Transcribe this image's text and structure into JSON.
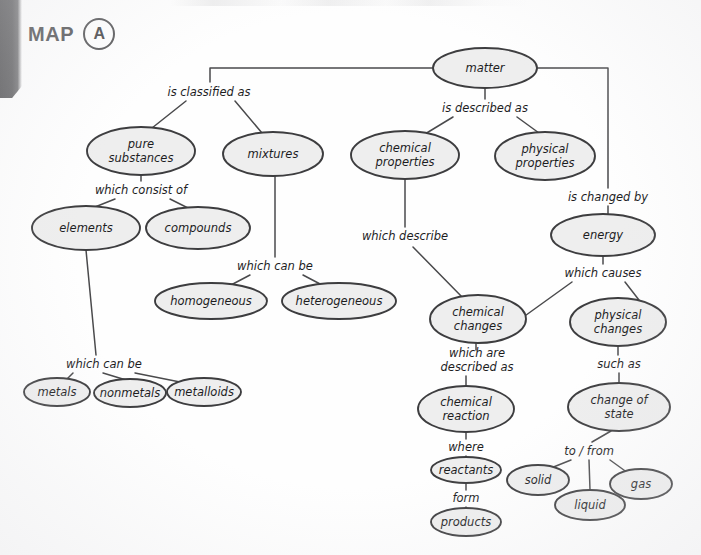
{
  "header": {
    "map_word": "MAP",
    "map_letter": "A"
  },
  "chart_data": {
    "type": "diagram",
    "diagram_kind": "concept-map",
    "title": "MAP A",
    "root": "matter",
    "node_fill_color": "#eeeeee",
    "node_stroke_color": "#3d3d3f",
    "nodes": [
      {
        "id": "matter",
        "label": "matter",
        "cx": 485,
        "cy": 68,
        "rx": 52,
        "ry": 20,
        "lines": [
          "matter"
        ]
      },
      {
        "id": "pure_substances",
        "label": "pure substances",
        "cx": 141,
        "cy": 151,
        "rx": 54,
        "ry": 24,
        "lines": [
          "pure",
          "substances"
        ]
      },
      {
        "id": "mixtures",
        "label": "mixtures",
        "cx": 273,
        "cy": 154,
        "rx": 50,
        "ry": 22,
        "lines": [
          "mixtures"
        ]
      },
      {
        "id": "chemical_properties",
        "label": "chemical properties",
        "cx": 405,
        "cy": 155,
        "rx": 54,
        "ry": 24,
        "lines": [
          "chemical",
          "properties"
        ]
      },
      {
        "id": "physical_properties",
        "label": "physical properties",
        "cx": 545,
        "cy": 156,
        "rx": 50,
        "ry": 24,
        "lines": [
          "physical",
          "properties"
        ]
      },
      {
        "id": "elements",
        "label": "elements",
        "cx": 86,
        "cy": 228,
        "rx": 54,
        "ry": 22,
        "lines": [
          "elements"
        ]
      },
      {
        "id": "compounds",
        "label": "compounds",
        "cx": 198,
        "cy": 228,
        "rx": 52,
        "ry": 21,
        "lines": [
          "compounds"
        ]
      },
      {
        "id": "energy",
        "label": "energy",
        "cx": 603,
        "cy": 235,
        "rx": 52,
        "ry": 21,
        "lines": [
          "energy"
        ]
      },
      {
        "id": "homogeneous",
        "label": "homogeneous",
        "cx": 211,
        "cy": 301,
        "rx": 56,
        "ry": 18,
        "lines": [
          "homogeneous"
        ]
      },
      {
        "id": "heterogeneous",
        "label": "heterogeneous",
        "cx": 339,
        "cy": 301,
        "rx": 57,
        "ry": 18,
        "lines": [
          "heterogeneous"
        ]
      },
      {
        "id": "chemical_changes",
        "label": "chemical changes",
        "cx": 478,
        "cy": 319,
        "rx": 48,
        "ry": 24,
        "lines": [
          "chemical",
          "changes"
        ]
      },
      {
        "id": "physical_changes",
        "label": "physical changes",
        "cx": 618,
        "cy": 322,
        "rx": 48,
        "ry": 24,
        "lines": [
          "physical",
          "changes"
        ]
      },
      {
        "id": "metals",
        "label": "metals",
        "cx": 57,
        "cy": 392,
        "rx": 33,
        "ry": 14,
        "lines": [
          "metals"
        ]
      },
      {
        "id": "nonmetals",
        "label": "nonmetals",
        "cx": 130,
        "cy": 393,
        "rx": 36,
        "ry": 14,
        "lines": [
          "nonmetals"
        ]
      },
      {
        "id": "metalloids",
        "label": "metalloids",
        "cx": 204,
        "cy": 392,
        "rx": 37,
        "ry": 14,
        "lines": [
          "metalloids"
        ]
      },
      {
        "id": "chemical_reaction",
        "label": "chemical reaction",
        "cx": 466,
        "cy": 409,
        "rx": 48,
        "ry": 23,
        "lines": [
          "chemical",
          "reaction"
        ]
      },
      {
        "id": "change_of_state",
        "label": "change of state",
        "cx": 619,
        "cy": 407,
        "rx": 51,
        "ry": 24,
        "lines": [
          "change of",
          "state"
        ]
      },
      {
        "id": "reactants",
        "label": "reactants",
        "cx": 466,
        "cy": 470,
        "rx": 35,
        "ry": 13,
        "lines": [
          "reactants"
        ]
      },
      {
        "id": "solid",
        "label": "solid",
        "cx": 538,
        "cy": 480,
        "rx": 31,
        "ry": 15,
        "lines": [
          "solid"
        ]
      },
      {
        "id": "gas",
        "label": "gas",
        "cx": 641,
        "cy": 484,
        "rx": 31,
        "ry": 15,
        "lines": [
          "gas"
        ]
      },
      {
        "id": "liquid",
        "label": "liquid",
        "cx": 590,
        "cy": 505,
        "rx": 35,
        "ry": 15,
        "lines": [
          "liquid"
        ]
      },
      {
        "id": "products",
        "label": "products",
        "cx": 466,
        "cy": 522,
        "rx": 35,
        "ry": 14,
        "lines": [
          "products"
        ]
      }
    ],
    "link_labels": [
      {
        "id": "is_classified_as",
        "text": "is classified as",
        "x": 209,
        "y": 92,
        "lines": [
          "is classified as"
        ]
      },
      {
        "id": "is_described_as",
        "text": "is described as",
        "x": 485,
        "y": 108,
        "lines": [
          "is described as"
        ]
      },
      {
        "id": "which_consist_of",
        "text": "which consist of",
        "x": 141,
        "y": 190,
        "lines": [
          "which consist of"
        ]
      },
      {
        "id": "is_changed_by",
        "text": "is changed by",
        "x": 608,
        "y": 197,
        "lines": [
          "is changed by"
        ]
      },
      {
        "id": "which_can_be_mix",
        "text": "which can be",
        "x": 275,
        "y": 266,
        "lines": [
          "which can be"
        ]
      },
      {
        "id": "which_describe",
        "text": "which describe",
        "x": 405,
        "y": 236,
        "lines": [
          "which describe"
        ]
      },
      {
        "id": "which_causes",
        "text": "which causes",
        "x": 603,
        "y": 273,
        "lines": [
          "which causes"
        ]
      },
      {
        "id": "which_can_be_elem",
        "text": "which can be",
        "x": 104,
        "y": 364,
        "lines": [
          "which can be"
        ]
      },
      {
        "id": "which_are_desc_as",
        "text": "which are described as",
        "x": 477,
        "y": 360,
        "lines": [
          "which are",
          "described as"
        ]
      },
      {
        "id": "such_as",
        "text": "such as",
        "x": 619,
        "y": 364,
        "lines": [
          "such as"
        ]
      },
      {
        "id": "where",
        "text": "where",
        "x": 466,
        "y": 447,
        "lines": [
          "where"
        ]
      },
      {
        "id": "to_from",
        "text": "to / from",
        "x": 589,
        "y": 451,
        "lines": [
          "to / from"
        ]
      },
      {
        "id": "form",
        "text": "form",
        "x": 466,
        "y": 498,
        "lines": [
          "form"
        ]
      }
    ],
    "edges": [
      {
        "from": "matter",
        "to": "is_classified_as",
        "path": "M 433 68 L 210 68 L 210 82"
      },
      {
        "from": "is_classified_as",
        "to": "pure_substances",
        "path": "M 186 101 L 152 128"
      },
      {
        "from": "is_classified_as",
        "to": "mixtures",
        "path": "M 235 101 L 262 133"
      },
      {
        "from": "matter",
        "to": "is_described_as",
        "path": "M 485 88 L 485 99"
      },
      {
        "from": "is_described_as",
        "to": "chemical_properties",
        "path": "M 453 117 L 425 134"
      },
      {
        "from": "is_described_as",
        "to": "physical_properties",
        "path": "M 517 117 L 539 133"
      },
      {
        "from": "matter",
        "to": "is_changed_by",
        "path": "M 537 68 L 608 68 L 608 188"
      },
      {
        "from": "is_changed_by",
        "to": "energy",
        "path": "M 608 206 L 608 215"
      },
      {
        "from": "pure_substances",
        "to": "which_consist_of",
        "path": "M 141 175 L 141 181"
      },
      {
        "from": "which_consist_of",
        "to": "elements",
        "path": "M 115 199 L 95 207"
      },
      {
        "from": "which_consist_of",
        "to": "compounds",
        "path": "M 170 199 L 188 208"
      },
      {
        "from": "mixtures",
        "to": "which_can_be_mix",
        "path": "M 275 176 L 275 257"
      },
      {
        "from": "which_can_be_mix",
        "to": "homogeneous",
        "path": "M 250 275 L 231 285"
      },
      {
        "from": "which_can_be_mix",
        "to": "heterogeneous",
        "path": "M 303 275 L 322 285"
      },
      {
        "from": "chemical_properties",
        "to": "which_describe",
        "path": "M 405 179 L 405 227"
      },
      {
        "from": "which_describe",
        "to": "chemical_changes",
        "path": "M 413 247 L 463 298"
      },
      {
        "from": "energy",
        "to": "which_causes",
        "path": "M 603 256 L 603 264"
      },
      {
        "from": "which_causes",
        "to": "chemical_changes",
        "path": "M 572 282 L 522 318"
      },
      {
        "from": "which_causes",
        "to": "physical_changes",
        "path": "M 625 282 L 639 300"
      },
      {
        "from": "elements",
        "to": "which_can_be_elem",
        "path": "M 86 250 L 96 355"
      },
      {
        "from": "which_can_be_elem",
        "to": "metals",
        "path": "M 73 373 L 67 379"
      },
      {
        "from": "which_can_be_elem",
        "to": "nonmetals",
        "path": "M 103 373 L 126 380"
      },
      {
        "from": "which_can_be_elem",
        "to": "metalloids",
        "path": "M 135 373 L 190 384"
      },
      {
        "from": "chemical_changes",
        "to": "which_are_desc_as",
        "path": "M 476 343 L 476 350"
      },
      {
        "from": "which_are_desc_as",
        "to": "chemical_reaction",
        "path": "M 466 376 L 466 386"
      },
      {
        "from": "physical_changes",
        "to": "such_as",
        "path": "M 618 346 L 618 355"
      },
      {
        "from": "such_as",
        "to": "change_of_state",
        "path": "M 619 373 L 619 383"
      },
      {
        "from": "chemical_reaction",
        "to": "where",
        "path": "M 466 432 L 466 439"
      },
      {
        "from": "where",
        "to": "reactants",
        "path": "M 466 456 L 466 457"
      },
      {
        "from": "reactants",
        "to": "form",
        "path": "M 466 483 L 466 490"
      },
      {
        "from": "form",
        "to": "products",
        "path": "M 466 507 L 466 508"
      },
      {
        "from": "change_of_state",
        "to": "to_from",
        "path": "M 611 431 L 592 442"
      },
      {
        "from": "to_from",
        "to": "solid",
        "path": "M 571 460 L 551 468"
      },
      {
        "from": "to_from",
        "to": "liquid",
        "path": "M 589 460 L 590 490"
      },
      {
        "from": "to_from",
        "to": "gas",
        "path": "M 610 460 L 628 473"
      }
    ]
  }
}
